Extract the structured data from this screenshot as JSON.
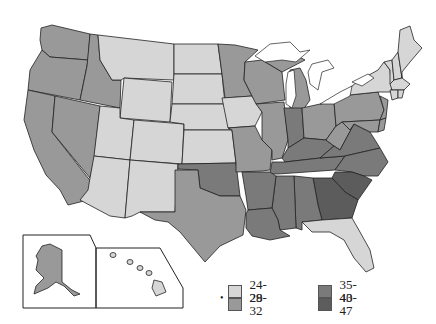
{
  "map": {
    "type": "choropleth",
    "region": "United States",
    "colors": {
      "c1": "#d6d6d6",
      "c2": "#999999",
      "c3": "#7a7a7a",
      "c4": "#5c5c5c"
    },
    "legend": [
      {
        "label": "24-28",
        "color_key": "c1"
      },
      {
        "label": "29-32",
        "color_key": "c2"
      },
      {
        "label": "35-40",
        "color_key": "c3"
      },
      {
        "label": "43-47",
        "color_key": "c4"
      }
    ],
    "legend_marker": "•",
    "states": {
      "WA": "c2",
      "OR": "c2",
      "CA": "c2",
      "NV": "c2",
      "ID": "c2",
      "MT": "c1",
      "WY": "c1",
      "UT": "c1",
      "CO": "c1",
      "AZ": "c1",
      "NM": "c1",
      "ND": "c1",
      "SD": "c1",
      "NE": "c1",
      "KS": "c1",
      "IA": "c1",
      "MN": "c2",
      "WI": "c2",
      "MI": "c2",
      "IL": "c2",
      "MO": "c2",
      "TX": "c2",
      "OK": "c3",
      "AR": "c3",
      "LA": "c3",
      "MS": "c3",
      "AL": "c3",
      "TN": "c3",
      "KY": "c3",
      "IN": "c3",
      "OH": "c2",
      "WV": "c2",
      "PA": "c2",
      "NJ": "c2",
      "VA": "c3",
      "NC": "c3",
      "MD": "c2",
      "DE": "c2",
      "GA": "c4",
      "SC": "c4",
      "FL": "c1",
      "NY": "c1",
      "VT": "c1",
      "NH": "c1",
      "ME": "c1",
      "MA": "c1",
      "CT": "c1",
      "RI": "c1",
      "AK": "c2",
      "HI": "c1"
    }
  }
}
